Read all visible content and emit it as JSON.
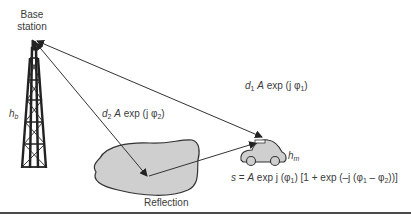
{
  "diagram": {
    "type": "two-ray multipath propagation",
    "base_station": {
      "label_line1": "Base",
      "label_line2": "station",
      "height_label": "h",
      "height_sub": "b"
    },
    "mobile": {
      "height_label": "h",
      "height_sub": "m"
    },
    "direct_ray": {
      "label": {
        "d": "d",
        "d_sub": "1",
        "A": "A",
        "text": "exp (j ",
        "phi": "φ",
        "phi_sub": "1",
        "close": ")"
      }
    },
    "reflected_ray": {
      "label": {
        "d": "d",
        "d_sub": "2",
        "A": "A",
        "text": "exp (j ",
        "phi": "φ",
        "phi_sub": "2",
        "close": ")"
      }
    },
    "reflector": {
      "label": "Reflection"
    },
    "formula": {
      "s": "s",
      "eq": " = ",
      "A": "A",
      "p1": " exp j (",
      "phi1": "φ",
      "sub1": "1",
      "p2": ") [1 + exp (–j (",
      "phi1b": "φ",
      "sub1b": "1",
      "minus": " – ",
      "phi2": "φ",
      "sub2": "2",
      "p3": "))]"
    },
    "colors": {
      "line": "#3a3a3a",
      "fill": "#cfcfcf",
      "text": "#3a3a3a"
    }
  }
}
